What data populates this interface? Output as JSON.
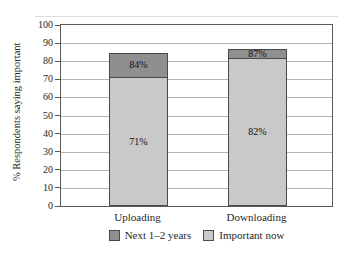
{
  "figure": {
    "type": "stacked bar chart figure from a document",
    "background": "#ffffff"
  },
  "chart_data": {
    "type": "bar",
    "stacked": true,
    "title": "",
    "xlabel": "",
    "ylabel": "% Respondents saying important",
    "ylim": [
      0,
      100
    ],
    "ytick_step": 10,
    "grid": true,
    "categories": [
      "Uploading",
      "Downloading"
    ],
    "series": [
      {
        "name": "Important now",
        "values": [
          71,
          82
        ],
        "labels": [
          "71%",
          "82%"
        ],
        "color": "#c9c9c9"
      },
      {
        "name": "Next 1–2 years",
        "values": [
          84,
          87
        ],
        "labels": [
          "84%",
          "87%"
        ],
        "color": "#8f8f8f",
        "note": "values are cumulative totals; segment height = total minus Important now"
      }
    ],
    "legend": [
      {
        "label": "Next 1–2 years",
        "color": "#8f8f8f"
      },
      {
        "label": "Important now",
        "color": "#c9c9c9"
      }
    ],
    "legend_position": "bottom",
    "colors": {
      "frame": "#595959",
      "gridline": "#b5b5b5",
      "bar_border": "#4a4a4a",
      "text": "#1f1f1f"
    }
  }
}
